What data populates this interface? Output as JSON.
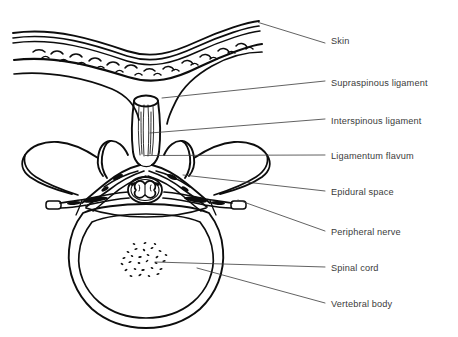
{
  "figure": {
    "background_color": "#ffffff",
    "line_color": "#0d0d0d",
    "label_color": "#3b3b3b",
    "leader_color": "#3a3a3a"
  },
  "labels": [
    {
      "id": "skin",
      "text": "Skin",
      "text_x": 331,
      "text_y": 44,
      "leader": "M258.5,22.5 L325,43"
    },
    {
      "id": "supraspinous-ligament",
      "text": "Supraspinous ligament",
      "text_x": 331,
      "text_y": 86,
      "leader": "M162,98 L325,81"
    },
    {
      "id": "interspinous-ligament",
      "text": "Interspinous ligament",
      "text_x": 331,
      "text_y": 124,
      "leader": "M150,133 L325,119"
    },
    {
      "id": "ligamentum-flavum",
      "text": "Ligamentum flavum",
      "text_x": 331,
      "text_y": 159,
      "leader": "M145,155.5 L325,155"
    },
    {
      "id": "epidural-space",
      "text": "Epidural space",
      "text_x": 331,
      "text_y": 195,
      "leader": "M183,175 L325,191"
    },
    {
      "id": "peripheral-nerve",
      "text": "Peripheral nerve",
      "text_x": 331,
      "text_y": 235,
      "leader": "M238,200 L325,231"
    },
    {
      "id": "spinal-cord",
      "text": "Spinal cord",
      "text_x": 331,
      "text_y": 271,
      "leader": "M155,262 L325,267"
    },
    {
      "id": "vertebral-body",
      "text": "Vertebral body",
      "text_x": 331,
      "text_y": 307,
      "leader": "M197,268 L325,303"
    }
  ],
  "structures": [
    {
      "id": "skin-epidermis-layers",
      "name": "skin surface layers"
    },
    {
      "id": "subcutaneous-fat",
      "name": "subcutaneous fat with dash texture"
    },
    {
      "id": "deep-fascia",
      "name": "deep fascia line"
    },
    {
      "id": "supraspinous-ligament-cap",
      "name": "supraspinous ligament cap"
    },
    {
      "id": "spinous-process",
      "name": "spinous process with striations"
    },
    {
      "id": "lamina",
      "name": "vertebral lamina"
    },
    {
      "id": "articular-processes",
      "name": "superior articular processes"
    },
    {
      "id": "transverse-processes",
      "name": "transverse processes"
    },
    {
      "id": "ligamentum-flavum-band",
      "name": "ligamentum flavum band"
    },
    {
      "id": "epidural-fat",
      "name": "epidural space fat deposits"
    },
    {
      "id": "spinal-cord-oval",
      "name": "spinal cord with butterfly grey matter"
    },
    {
      "id": "nerve-roots",
      "name": "bilateral peripheral nerve roots"
    },
    {
      "id": "vertebral-body-outline",
      "name": "vertebral body double ring"
    },
    {
      "id": "cancellous-bone",
      "name": "cancellous bone stipple"
    }
  ]
}
